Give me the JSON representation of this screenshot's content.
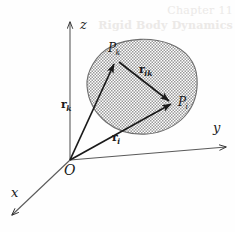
{
  "figure": {
    "caption": "",
    "background_color": "#fefefe",
    "ink_color": "#1a1a1a",
    "body_fill_color": "#a8a8a8"
  },
  "axes": {
    "z_label": "z",
    "y_label": "y",
    "x_label": "x",
    "origin_label": "O"
  },
  "points": [
    {
      "id": "Pk",
      "base": "P",
      "sub": "k"
    },
    {
      "id": "Pi",
      "base": "P",
      "sub": "i"
    }
  ],
  "vectors": [
    {
      "id": "rk",
      "base": "r",
      "sub": "k"
    },
    {
      "id": "ri",
      "base": "r",
      "sub": "i"
    },
    {
      "id": "rik",
      "base": "r",
      "sub": "ik"
    }
  ],
  "ghost_text": {
    "line1": "Chapter 11",
    "line2": "Rigid Body Dynamics"
  }
}
